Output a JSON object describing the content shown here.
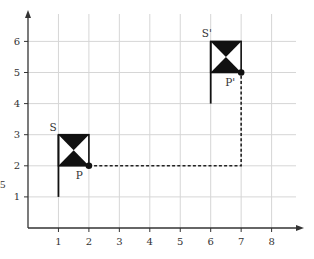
{
  "chart_data": {
    "type": "diagram",
    "title": "",
    "xlabel": "",
    "ylabel": "",
    "x_ticks": [
      "1",
      "2",
      "3",
      "4",
      "5",
      "6",
      "7",
      "8"
    ],
    "y_ticks": [
      "1",
      "2",
      "3",
      "4",
      "5",
      "6"
    ],
    "xlim": [
      0,
      8.8
    ],
    "ylim": [
      0,
      6.8
    ],
    "grid": true,
    "shapes": [
      {
        "name": "S",
        "label": "S",
        "description": "flag with hourglass (bowtie) fill",
        "pole": {
          "x": 1,
          "y_from": 1,
          "y_to": 3
        },
        "box": {
          "x_from": 1,
          "x_to": 2,
          "y_from": 2,
          "y_to": 3
        },
        "point": {
          "name": "P",
          "label": "P",
          "x": 2,
          "y": 2
        }
      },
      {
        "name": "S'",
        "label": "S'",
        "description": "translated flag with hourglass (bowtie) fill",
        "pole": {
          "x": 6,
          "y_from": 4,
          "y_to": 6
        },
        "box": {
          "x_from": 6,
          "x_to": 7,
          "y_from": 5,
          "y_to": 6
        },
        "point": {
          "name": "P'",
          "label": "P'",
          "x": 7,
          "y": 5
        }
      }
    ],
    "translation_path": {
      "style": "dashed",
      "points": [
        [
          2,
          2
        ],
        [
          7,
          2
        ],
        [
          7,
          5
        ]
      ],
      "vector": [
        5,
        3
      ]
    }
  },
  "labels": {
    "S": "S",
    "S_prime": "S'",
    "P": "P",
    "P_prime": "P'",
    "stray_char": "5"
  },
  "colors": {
    "axis": "#333333",
    "grid": "#d6d6d6",
    "shape": "#111111",
    "path": "#222222"
  }
}
